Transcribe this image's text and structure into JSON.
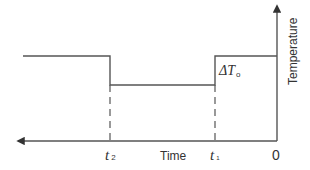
{
  "diagram": {
    "y_axis_label": "Temperature",
    "x_axis_label": "Time",
    "origin_label": "0",
    "t1_label": {
      "main": "t",
      "sub": "1"
    },
    "t2_label": {
      "main": "t",
      "sub": "2"
    },
    "delta_label": {
      "main": "ΔT",
      "sub": "o"
    },
    "line_color": "#555555",
    "text_color": "#333333"
  }
}
